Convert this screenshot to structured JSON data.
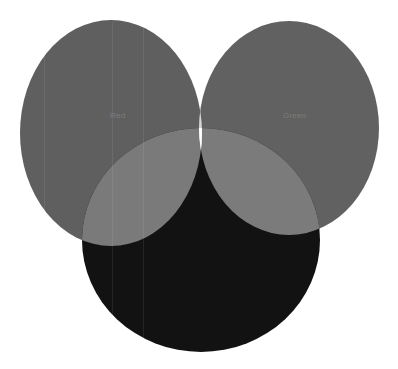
{
  "diagram": {
    "title": "",
    "type": "venn-rgb-additive",
    "background": "#ffffff",
    "circles": [
      {
        "id": "red",
        "label": "Red",
        "cx": 111,
        "cy": 133,
        "rx": 91,
        "ry": 113,
        "fill": "#5f5f5f"
      },
      {
        "id": "green",
        "label": "Green",
        "cx": 289,
        "cy": 128,
        "rx": 90,
        "ry": 107,
        "fill": "#616161"
      },
      {
        "id": "blue",
        "label": "",
        "cx": 201,
        "cy": 240,
        "rx": 119,
        "ry": 112,
        "fill": "#121212"
      }
    ],
    "overlaps": {
      "red_green": "#d8d8d8",
      "red_blue": "#7a7a7a",
      "green_blue": "#7b7b7b",
      "all_three": "#ffffff"
    },
    "labels": {
      "red": "Red",
      "green": "Green"
    }
  }
}
